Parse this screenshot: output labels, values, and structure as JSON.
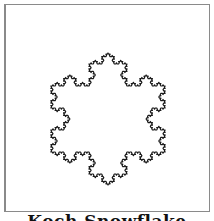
{
  "figure": {
    "title": "Koch Snowflake",
    "shape": "koch-snowflake",
    "iterations": 4,
    "center": [
      108,
      119
    ],
    "circumradius": 66,
    "stroke_color": "#1a1a1a",
    "stroke_width": 1.2,
    "frame_color": "#8a8a8a"
  }
}
